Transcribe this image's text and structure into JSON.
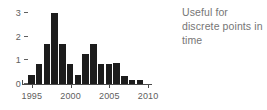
{
  "annotation": {
    "lines": [
      "Useful for",
      "discrete points in",
      "time"
    ]
  },
  "chart_data": {
    "type": "bar",
    "title": "",
    "xlabel": "",
    "ylabel": "",
    "xlim": [
      1994.5,
      2010.5
    ],
    "ylim": [
      0,
      3.2
    ],
    "grid": false,
    "legend": null,
    "bar_color": "#1c1c1c",
    "axis_color": "#4a4a4a",
    "tick_label_color": "#606060",
    "annotation_color": "#767676",
    "x_ticks": [
      1995,
      2000,
      2005,
      2010
    ],
    "x_tick_labels": [
      "1995",
      "2000",
      "2005",
      "2010"
    ],
    "y_ticks": [
      0,
      1,
      2,
      3
    ],
    "y_tick_labels": [
      "0",
      "1",
      "2",
      "3"
    ],
    "categories": [
      1995,
      1996,
      1997,
      1998,
      1999,
      2000,
      2001,
      2002,
      2003,
      2004,
      2005,
      2006,
      2007,
      2008,
      2009,
      2010
    ],
    "values": [
      0.4,
      0.85,
      1.7,
      3.0,
      1.7,
      0.85,
      0.4,
      1.25,
      1.7,
      0.85,
      0.85,
      0.9,
      0.35,
      0.15,
      0.15,
      0.0
    ]
  }
}
